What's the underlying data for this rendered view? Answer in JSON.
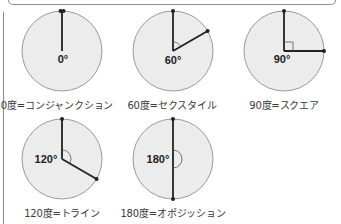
{
  "colors": {
    "circle_fill": "#ececec",
    "circle_stroke": "#9a9a9a",
    "line": "#222222",
    "frame": "#8a8a8a",
    "caption_text": "#3a3a3a"
  },
  "aspects": [
    {
      "id": "conjunction",
      "angle_deg": 0,
      "degree_label": "0°",
      "caption": "0度=コンジャンクション"
    },
    {
      "id": "sextile",
      "angle_deg": 60,
      "degree_label": "60°",
      "caption": "60度=セクスタイル"
    },
    {
      "id": "square",
      "angle_deg": 90,
      "degree_label": "90°",
      "caption": "90度=スクエア"
    },
    {
      "id": "trine",
      "angle_deg": 120,
      "degree_label": "120°",
      "caption": "120度=トライン"
    },
    {
      "id": "opposition",
      "angle_deg": 180,
      "degree_label": "180°",
      "caption": "180度=オポジッション"
    }
  ]
}
